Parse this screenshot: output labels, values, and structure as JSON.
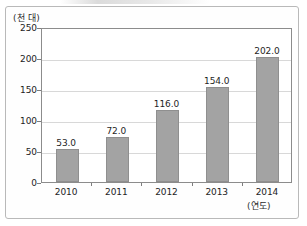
{
  "chart_data": {
    "type": "bar",
    "title": "",
    "subtitle": "",
    "xlabel": "(연도)",
    "ylabel": "(천 대)",
    "categories": [
      "2010",
      "2011",
      "2012",
      "2013",
      "2014"
    ],
    "values": [
      53.0,
      72.0,
      116.0,
      154.0,
      202.0
    ],
    "value_labels": [
      "53.0",
      "72.0",
      "116.0",
      "154.0",
      "202.0"
    ],
    "series": [
      {
        "name": "",
        "values": [
          53.0,
          72.0,
          116.0,
          154.0,
          202.0
        ],
        "color": "#a3a3a3"
      }
    ],
    "ylim": [
      0,
      250
    ],
    "ytick_values": [
      0,
      50,
      100,
      150,
      200,
      250
    ],
    "ytick_labels": [
      "0",
      "50",
      "100",
      "150",
      "200",
      "250"
    ],
    "grid": true,
    "grid_axis": "y",
    "legend": false,
    "legend_position": "none",
    "bar_color": "#a3a3a3",
    "bar_edge_color": "#8f8f8f",
    "plot_background": "#ffffff",
    "axis_color": "#8c8c8c",
    "gridline_color": "#d8d8d8"
  }
}
